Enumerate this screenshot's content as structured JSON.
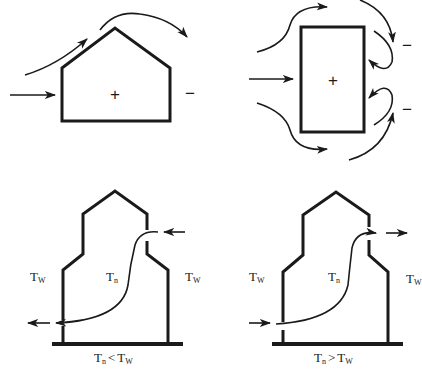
{
  "diagram": {
    "panels": [
      {
        "id": "wind-pitched-roof",
        "inside_sign": "+",
        "leeward_sign": "−"
      },
      {
        "id": "wind-plan-view",
        "inside_sign": "+",
        "leeward_signs": [
          "−",
          "−"
        ]
      },
      {
        "id": "stack-effect-cold-inside",
        "outside_left": {
          "base": "T",
          "sub": "W"
        },
        "inside": {
          "base": "T",
          "sub": "n"
        },
        "outside_right": {
          "base": "T",
          "sub": "W"
        },
        "caption": {
          "left": "T",
          "left_sub": "n",
          "op": "<",
          "right": "T",
          "right_sub": "W"
        }
      },
      {
        "id": "stack-effect-warm-inside",
        "outside_left": {
          "base": "T",
          "sub": "W"
        },
        "inside": {
          "base": "T",
          "sub": "n"
        },
        "outside_right": {
          "base": "T",
          "sub": "W"
        },
        "caption": {
          "left": "T",
          "left_sub": "n",
          "op": ">",
          "right": "T",
          "right_sub": "W"
        }
      }
    ],
    "colors": {
      "line": "#1a1a1a",
      "background": "#ffffff"
    }
  }
}
